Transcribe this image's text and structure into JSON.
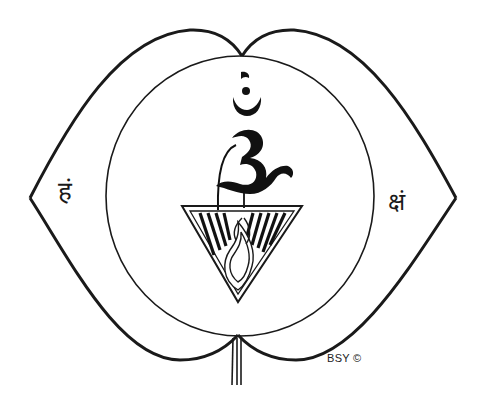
{
  "illustration": {
    "subject": "Ajna chakra symbol",
    "outer_shape": "two-petal lotus",
    "center_symbol": "Om",
    "bindu_symbol": "chandrabindu",
    "left_petal_syllable": "हं",
    "right_petal_syllable": "क्षं",
    "inner_emblem": "inverted triangle with flame and lingam",
    "copyright": "BSY ©"
  },
  "colors": {
    "ink": "#1a1a1a",
    "background": "#ffffff"
  }
}
